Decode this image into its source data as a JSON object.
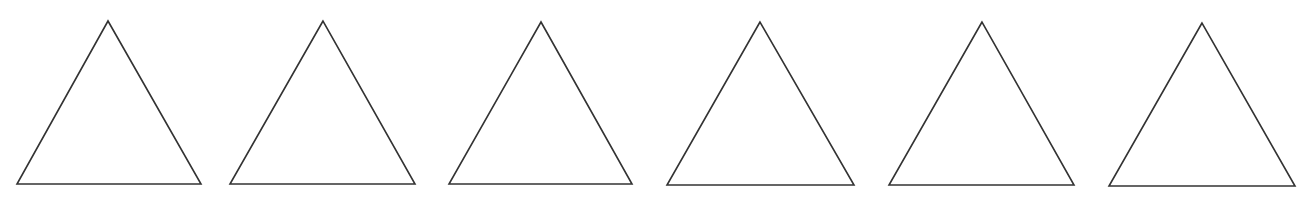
{
  "diagram": {
    "background": "#ffffff",
    "stroke_color": "#333333",
    "stroke_width": 1.6,
    "fill": "#ffffff",
    "shapes": [
      {
        "type": "triangle",
        "points": [
          [
            108,
            21
          ],
          [
            17,
            184
          ],
          [
            201,
            184
          ]
        ]
      },
      {
        "type": "triangle",
        "points": [
          [
            323,
            21
          ],
          [
            230,
            184
          ],
          [
            415,
            184
          ]
        ]
      },
      {
        "type": "triangle",
        "points": [
          [
            541,
            22
          ],
          [
            449,
            184
          ],
          [
            632,
            184
          ]
        ]
      },
      {
        "type": "triangle",
        "points": [
          [
            760,
            22
          ],
          [
            667,
            185
          ],
          [
            854,
            185
          ]
        ]
      },
      {
        "type": "triangle",
        "points": [
          [
            982,
            22
          ],
          [
            889,
            185
          ],
          [
            1074,
            185
          ]
        ]
      },
      {
        "type": "triangle",
        "points": [
          [
            1202,
            23
          ],
          [
            1109,
            186
          ],
          [
            1295,
            186
          ]
        ]
      }
    ]
  }
}
